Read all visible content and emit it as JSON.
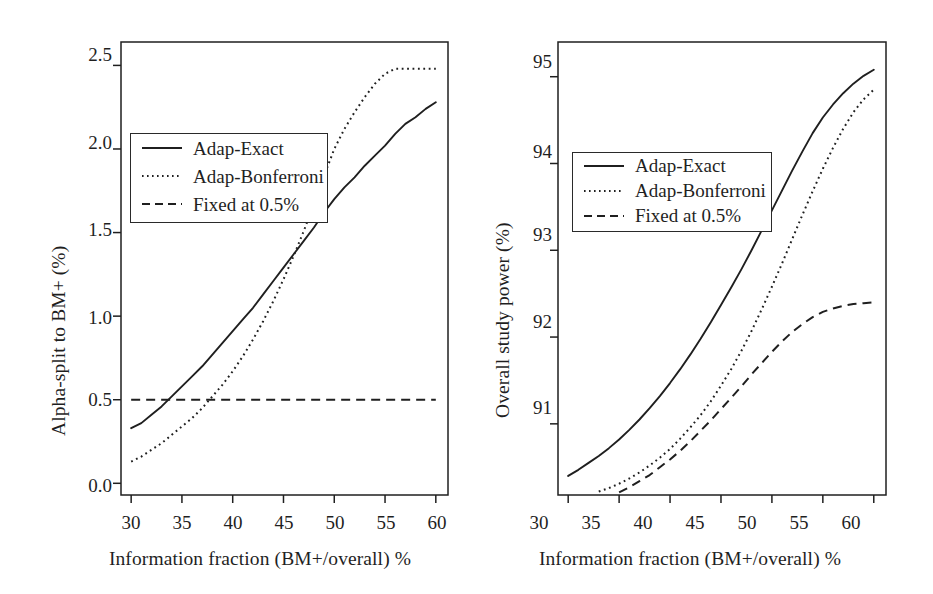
{
  "figure": {
    "panel_count": 2,
    "background": "#ffffff",
    "ink_color": "#1f1f1f"
  },
  "chart_data": [
    {
      "type": "line",
      "panel": "left",
      "title": "",
      "xlabel": "Information fraction (BM+/overall) %",
      "ylabel": "Alpha-split to BM+ (%)",
      "xlim": [
        29.0,
        61.2
      ],
      "ylim": [
        -0.07,
        2.64
      ],
      "xticks": [
        30,
        35,
        40,
        45,
        50,
        55,
        60
      ],
      "xtick_labels": [
        "30",
        "35",
        "40",
        "45",
        "50",
        "55",
        "60"
      ],
      "yticks": [
        0.0,
        0.5,
        1.0,
        1.5,
        2.0,
        2.5
      ],
      "ytick_labels": [
        "0.0",
        "0.5",
        "1.0",
        "1.5",
        "2.0",
        "2.5"
      ],
      "grid": false,
      "legend_position": "upper-left",
      "series": [
        {
          "name": "Adap-Exact",
          "style": "solid",
          "color": "#1f1f1f",
          "x": [
            30,
            31,
            32,
            33,
            34,
            35,
            36,
            37,
            38,
            39,
            40,
            41,
            42,
            43,
            44,
            45,
            46,
            47,
            48,
            49,
            50,
            51,
            52,
            53,
            54,
            55,
            56,
            57,
            58,
            59,
            60
          ],
          "y": [
            0.33,
            0.36,
            0.41,
            0.46,
            0.52,
            0.58,
            0.64,
            0.7,
            0.77,
            0.84,
            0.91,
            0.98,
            1.05,
            1.13,
            1.21,
            1.29,
            1.37,
            1.45,
            1.53,
            1.62,
            1.7,
            1.77,
            1.83,
            1.9,
            1.96,
            2.02,
            2.09,
            2.15,
            2.19,
            2.24,
            2.28
          ]
        },
        {
          "name": "Adap-Bonferroni",
          "style": "dotted",
          "color": "#1f1f1f",
          "x": [
            30,
            31,
            32,
            33,
            34,
            35,
            36,
            37,
            38,
            39,
            40,
            41,
            42,
            43,
            44,
            45,
            46,
            47,
            48,
            49,
            50,
            51,
            52,
            53,
            54,
            55,
            56,
            56.5,
            57,
            58,
            59,
            60
          ],
          "y": [
            0.13,
            0.16,
            0.2,
            0.24,
            0.29,
            0.34,
            0.39,
            0.45,
            0.52,
            0.59,
            0.67,
            0.76,
            0.86,
            0.97,
            1.09,
            1.22,
            1.36,
            1.51,
            1.67,
            1.84,
            2.0,
            2.12,
            2.22,
            2.31,
            2.39,
            2.45,
            2.48,
            2.48,
            2.48,
            2.48,
            2.48,
            2.48
          ]
        },
        {
          "name": "Fixed at 0.5%",
          "style": "dashed",
          "color": "#1f1f1f",
          "x": [
            30,
            60
          ],
          "y": [
            0.5,
            0.5
          ]
        }
      ]
    },
    {
      "type": "line",
      "panel": "right",
      "title": "",
      "xlabel": "Information fraction (BM+/overall) %",
      "ylabel": "Overall study power (%)",
      "xlim": [
        29.0,
        61.2
      ],
      "ylim": [
        90.18,
        95.4
      ],
      "xticks": [
        30,
        35,
        40,
        45,
        50,
        55,
        60
      ],
      "xtick_labels": [
        "30",
        "35",
        "40",
        "45",
        "50",
        "55",
        "60"
      ],
      "yticks": [
        91,
        92,
        93,
        94,
        95
      ],
      "ytick_labels": [
        "91",
        "92",
        "93",
        "94",
        "95"
      ],
      "grid": false,
      "legend_position": "upper-left",
      "series": [
        {
          "name": "Adap-Exact",
          "style": "solid",
          "color": "#1f1f1f",
          "x": [
            30,
            31,
            32,
            33,
            34,
            35,
            36,
            37,
            38,
            39,
            40,
            41,
            42,
            43,
            44,
            45,
            46,
            47,
            48,
            49,
            50,
            51,
            52,
            53,
            54,
            55,
            56,
            57,
            58,
            59,
            60
          ],
          "y": [
            90.4,
            90.47,
            90.55,
            90.63,
            90.72,
            90.82,
            90.93,
            91.05,
            91.18,
            91.32,
            91.47,
            91.63,
            91.8,
            91.98,
            92.17,
            92.37,
            92.57,
            92.78,
            93.0,
            93.23,
            93.46,
            93.69,
            93.92,
            94.14,
            94.35,
            94.53,
            94.68,
            94.81,
            94.92,
            95.01,
            95.08
          ]
        },
        {
          "name": "Adap-Bonferroni",
          "style": "dotted",
          "color": "#1f1f1f",
          "x": [
            33,
            34,
            35,
            36,
            37,
            38,
            39,
            40,
            41,
            42,
            43,
            44,
            45,
            46,
            47,
            48,
            49,
            50,
            51,
            52,
            53,
            54,
            55,
            56,
            57,
            58,
            59,
            60
          ],
          "y": [
            90.22,
            90.26,
            90.31,
            90.37,
            90.44,
            90.52,
            90.61,
            90.71,
            90.83,
            90.96,
            91.1,
            91.26,
            91.44,
            91.63,
            91.84,
            92.07,
            92.32,
            92.58,
            92.85,
            93.13,
            93.41,
            93.68,
            93.94,
            94.18,
            94.4,
            94.59,
            94.74,
            94.85
          ]
        },
        {
          "name": "Fixed at 0.5%",
          "style": "dashed",
          "color": "#1f1f1f",
          "x": [
            35,
            36,
            37,
            38,
            39,
            40,
            41,
            42,
            43,
            44,
            45,
            46,
            47,
            48,
            49,
            50,
            51,
            52,
            53,
            54,
            55,
            56,
            57,
            58,
            59,
            60
          ],
          "y": [
            90.21,
            90.27,
            90.34,
            90.41,
            90.5,
            90.59,
            90.69,
            90.8,
            90.92,
            91.04,
            91.17,
            91.3,
            91.43,
            91.57,
            91.7,
            91.83,
            91.95,
            92.06,
            92.15,
            92.23,
            92.29,
            92.33,
            92.36,
            92.38,
            92.39,
            92.4
          ]
        }
      ]
    }
  ],
  "legend": {
    "entries": [
      {
        "label": "Adap-Exact",
        "style": "solid"
      },
      {
        "label": "Adap-Bonferroni",
        "style": "dotted"
      },
      {
        "label": "Fixed at 0.5%",
        "style": "dashed"
      }
    ]
  }
}
